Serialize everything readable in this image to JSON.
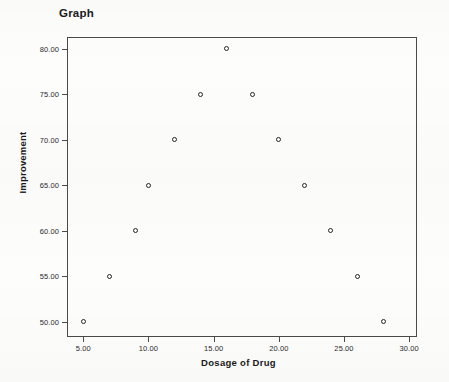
{
  "chart_data": {
    "type": "scatter",
    "title": "Graph",
    "xlabel": "Dosage of Drug",
    "ylabel": "Improvement",
    "xlim": [
      3.75,
      30.6
    ],
    "ylim": [
      48.3,
      81.3
    ],
    "grid": false,
    "legend": null,
    "xticks": [
      "5.00",
      "10.00",
      "15.00",
      "20.00",
      "25.00",
      "30.00"
    ],
    "xtick_values": [
      5,
      10,
      15,
      20,
      25,
      30
    ],
    "yticks": [
      "50.00",
      "55.00",
      "60.00",
      "65.00",
      "70.00",
      "75.00",
      "80.00"
    ],
    "ytick_values": [
      50,
      55,
      60,
      65,
      70,
      75,
      80
    ],
    "marker": "open-circle",
    "marker_color": "#242424",
    "points": [
      {
        "x": 5,
        "y": 50
      },
      {
        "x": 7,
        "y": 55
      },
      {
        "x": 9,
        "y": 60
      },
      {
        "x": 10,
        "y": 65
      },
      {
        "x": 12,
        "y": 70
      },
      {
        "x": 14,
        "y": 75
      },
      {
        "x": 16,
        "y": 80
      },
      {
        "x": 18,
        "y": 75
      },
      {
        "x": 20,
        "y": 70
      },
      {
        "x": 22,
        "y": 65
      },
      {
        "x": 24,
        "y": 60
      },
      {
        "x": 26,
        "y": 55
      },
      {
        "x": 28,
        "y": 50
      }
    ]
  }
}
